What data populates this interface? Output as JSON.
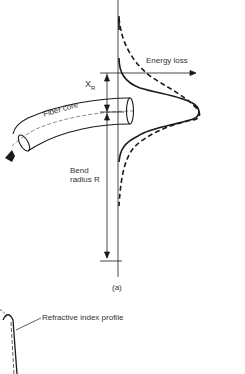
{
  "figure": {
    "panel_label": "(a)",
    "labels": {
      "energy_loss": "Energy loss",
      "xr_main": "X",
      "xr_sub": "R",
      "fiber_core": "Fiber  core",
      "bend_line1": "Bend",
      "bend_line2": "radius R",
      "refractive_profile": "Refractive index profile"
    },
    "elements": [
      "vertical-axis",
      "energy-loss-axis-arrow",
      "solid-field-curve",
      "dashed-field-curve",
      "bent-fiber",
      "xr-dimension-arrow",
      "bend-radius-dimension-arrow",
      "propagation-arrow",
      "refractive-index-profile-curve"
    ],
    "colors": {
      "ink": "#1a1a1a",
      "background": "#ffffff"
    }
  }
}
